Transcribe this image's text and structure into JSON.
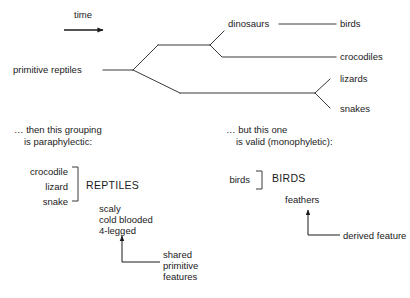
{
  "diagram": {
    "title_label": "time",
    "tree": {
      "root_label": "primitive reptiles",
      "internal_labels": [
        "dinosaurs"
      ],
      "tips": [
        {
          "name": "birds"
        },
        {
          "name": "crocodiles"
        },
        {
          "name": "lizards"
        },
        {
          "name": "snakes"
        }
      ]
    },
    "left_block": {
      "heading_line1": "… then this grouping",
      "heading_line2": "is paraphylectic:",
      "members": [
        "crocodile",
        "lizard",
        "snake"
      ],
      "group_name": "REPTILES",
      "traits": [
        "scaly",
        "cold blooded",
        "4-legged"
      ],
      "callout_line1": "shared",
      "callout_line2": "primitive",
      "callout_line3": "features"
    },
    "right_block": {
      "heading_line1": "… but this one",
      "heading_line2": "is valid (monophyletic):",
      "members": [
        "birds"
      ],
      "group_name": "BIRDS",
      "traits": [
        "feathers"
      ],
      "callout_line1": "derived feature"
    },
    "colors": {
      "ink": "#1a1a1a",
      "line": "#3a3a3a",
      "background": "#ffffff"
    }
  }
}
